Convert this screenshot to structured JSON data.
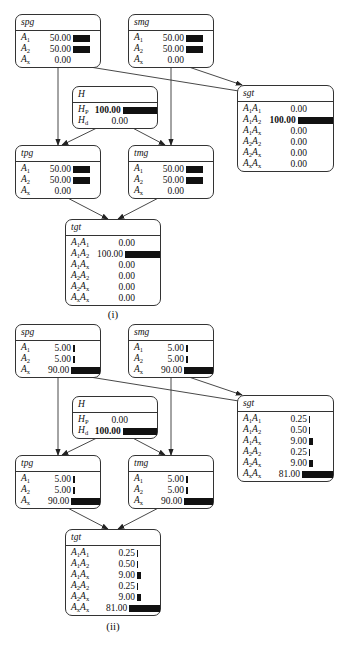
{
  "bar_scale_max": 100,
  "diagrams": [
    {
      "caption": "(i)",
      "nodes": {
        "spg": {
          "title": "spg",
          "rows": [
            {
              "label": "A",
              "sub": "1",
              "value": "50.00",
              "num": 50,
              "bold": false
            },
            {
              "label": "A",
              "sub": "2",
              "value": "50.00",
              "num": 50,
              "bold": false
            },
            {
              "label": "A",
              "sub": "x",
              "value": "0.00",
              "num": 0,
              "bold": false
            }
          ]
        },
        "smg": {
          "title": "smg",
          "rows": [
            {
              "label": "A",
              "sub": "1",
              "value": "50.00",
              "num": 50,
              "bold": false
            },
            {
              "label": "A",
              "sub": "2",
              "value": "50.00",
              "num": 50,
              "bold": false
            },
            {
              "label": "A",
              "sub": "x",
              "value": "0.00",
              "num": 0,
              "bold": false
            }
          ]
        },
        "H": {
          "title": "H",
          "rows": [
            {
              "label": "H",
              "sub": "P",
              "value": "100.00",
              "num": 100,
              "bold": true
            },
            {
              "label": "H",
              "sub": "d",
              "value": "0.00",
              "num": 0,
              "bold": false
            }
          ]
        },
        "sgt": {
          "title": "sgt",
          "rows": [
            {
              "label": "A",
              "sub": "1",
              "label2": "A",
              "sub2": "1",
              "value": "0.00",
              "num": 0,
              "bold": false
            },
            {
              "label": "A",
              "sub": "1",
              "label2": "A",
              "sub2": "2",
              "value": "100.00",
              "num": 100,
              "bold": true
            },
            {
              "label": "A",
              "sub": "1",
              "label2": "A",
              "sub2": "x",
              "value": "0.00",
              "num": 0,
              "bold": false
            },
            {
              "label": "A",
              "sub": "2",
              "label2": "A",
              "sub2": "2",
              "value": "0.00",
              "num": 0,
              "bold": false
            },
            {
              "label": "A",
              "sub": "2",
              "label2": "A",
              "sub2": "x",
              "value": "0.00",
              "num": 0,
              "bold": false
            },
            {
              "label": "A",
              "sub": "x",
              "label2": "A",
              "sub2": "x",
              "value": "0.00",
              "num": 0,
              "bold": false
            }
          ]
        },
        "tpg": {
          "title": "tpg",
          "rows": [
            {
              "label": "A",
              "sub": "1",
              "value": "50.00",
              "num": 50,
              "bold": false
            },
            {
              "label": "A",
              "sub": "2",
              "value": "50.00",
              "num": 50,
              "bold": false
            },
            {
              "label": "A",
              "sub": "x",
              "value": "0.00",
              "num": 0,
              "bold": false
            }
          ]
        },
        "tmg": {
          "title": "tmg",
          "rows": [
            {
              "label": "A",
              "sub": "1",
              "value": "50.00",
              "num": 50,
              "bold": false
            },
            {
              "label": "A",
              "sub": "2",
              "value": "50.00",
              "num": 50,
              "bold": false
            },
            {
              "label": "A",
              "sub": "x",
              "value": "0.00",
              "num": 0,
              "bold": false
            }
          ]
        },
        "tgt": {
          "title": "tgt",
          "rows": [
            {
              "label": "A",
              "sub": "1",
              "label2": "A",
              "sub2": "1",
              "value": "0.00",
              "num": 0,
              "bold": false
            },
            {
              "label": "A",
              "sub": "1",
              "label2": "A",
              "sub2": "2",
              "value": "100.00",
              "num": 100,
              "bold": false
            },
            {
              "label": "A",
              "sub": "1",
              "label2": "A",
              "sub2": "x",
              "value": "0.00",
              "num": 0,
              "bold": false
            },
            {
              "label": "A",
              "sub": "2",
              "label2": "A",
              "sub2": "2",
              "value": "0.00",
              "num": 0,
              "bold": false
            },
            {
              "label": "A",
              "sub": "2",
              "label2": "A",
              "sub2": "x",
              "value": "0.00",
              "num": 0,
              "bold": false
            },
            {
              "label": "A",
              "sub": "x",
              "label2": "A",
              "sub2": "x",
              "value": "0.00",
              "num": 0,
              "bold": false
            }
          ]
        }
      }
    },
    {
      "caption": "(ii)",
      "nodes": {
        "spg": {
          "title": "spg",
          "rows": [
            {
              "label": "A",
              "sub": "1",
              "value": "5.00",
              "num": 5,
              "bold": false
            },
            {
              "label": "A",
              "sub": "2",
              "value": "5.00",
              "num": 5,
              "bold": false
            },
            {
              "label": "A",
              "sub": "x",
              "value": "90.00",
              "num": 90,
              "bold": false
            }
          ]
        },
        "smg": {
          "title": "smg",
          "rows": [
            {
              "label": "A",
              "sub": "1",
              "value": "5.00",
              "num": 5,
              "bold": false
            },
            {
              "label": "A",
              "sub": "2",
              "value": "5.00",
              "num": 5,
              "bold": false
            },
            {
              "label": "A",
              "sub": "x",
              "value": "90.00",
              "num": 90,
              "bold": false
            }
          ]
        },
        "H": {
          "title": "H",
          "rows": [
            {
              "label": "H",
              "sub": "P",
              "value": "0.00",
              "num": 0,
              "bold": false
            },
            {
              "label": "H",
              "sub": "d",
              "value": "100.00",
              "num": 100,
              "bold": true
            }
          ]
        },
        "sgt": {
          "title": "sgt",
          "rows": [
            {
              "label": "A",
              "sub": "1",
              "label2": "A",
              "sub2": "1",
              "value": "0.25",
              "num": 0.25,
              "bold": false
            },
            {
              "label": "A",
              "sub": "1",
              "label2": "A",
              "sub2": "2",
              "value": "0.50",
              "num": 0.5,
              "bold": false
            },
            {
              "label": "A",
              "sub": "1",
              "label2": "A",
              "sub2": "x",
              "value": "9.00",
              "num": 9,
              "bold": false
            },
            {
              "label": "A",
              "sub": "2",
              "label2": "A",
              "sub2": "2",
              "value": "0.25",
              "num": 0.25,
              "bold": false
            },
            {
              "label": "A",
              "sub": "2",
              "label2": "A",
              "sub2": "x",
              "value": "9.00",
              "num": 9,
              "bold": false
            },
            {
              "label": "A",
              "sub": "x",
              "label2": "A",
              "sub2": "x",
              "value": "81.00",
              "num": 81,
              "bold": false
            }
          ]
        },
        "tpg": {
          "title": "tpg",
          "rows": [
            {
              "label": "A",
              "sub": "1",
              "value": "5.00",
              "num": 5,
              "bold": false
            },
            {
              "label": "A",
              "sub": "2",
              "value": "5.00",
              "num": 5,
              "bold": false
            },
            {
              "label": "A",
              "sub": "x",
              "value": "90.00",
              "num": 90,
              "bold": false
            }
          ]
        },
        "tmg": {
          "title": "tmg",
          "rows": [
            {
              "label": "A",
              "sub": "1",
              "value": "5.00",
              "num": 5,
              "bold": false
            },
            {
              "label": "A",
              "sub": "2",
              "value": "5.00",
              "num": 5,
              "bold": false
            },
            {
              "label": "A",
              "sub": "x",
              "value": "90.00",
              "num": 90,
              "bold": false
            }
          ]
        },
        "tgt": {
          "title": "tgt",
          "rows": [
            {
              "label": "A",
              "sub": "1",
              "label2": "A",
              "sub2": "1",
              "value": "0.25",
              "num": 0.25,
              "bold": false
            },
            {
              "label": "A",
              "sub": "1",
              "label2": "A",
              "sub2": "2",
              "value": "0.50",
              "num": 0.5,
              "bold": false
            },
            {
              "label": "A",
              "sub": "1",
              "label2": "A",
              "sub2": "x",
              "value": "9.00",
              "num": 9,
              "bold": false
            },
            {
              "label": "A",
              "sub": "2",
              "label2": "A",
              "sub2": "2",
              "value": "0.25",
              "num": 0.25,
              "bold": false
            },
            {
              "label": "A",
              "sub": "2",
              "label2": "A",
              "sub2": "x",
              "value": "9.00",
              "num": 9,
              "bold": false
            },
            {
              "label": "A",
              "sub": "x",
              "label2": "A",
              "sub2": "x",
              "value": "81.00",
              "num": 81,
              "bold": false
            }
          ]
        }
      }
    }
  ],
  "edges": [
    {
      "from": "spg",
      "to": "tpg"
    },
    {
      "from": "spg",
      "to": "sgt"
    },
    {
      "from": "smg",
      "to": "sgt"
    },
    {
      "from": "smg",
      "to": "tmg"
    },
    {
      "from": "H",
      "to": "tpg"
    },
    {
      "from": "H",
      "to": "tmg"
    },
    {
      "from": "tpg",
      "to": "tgt"
    },
    {
      "from": "tmg",
      "to": "tgt"
    }
  ]
}
